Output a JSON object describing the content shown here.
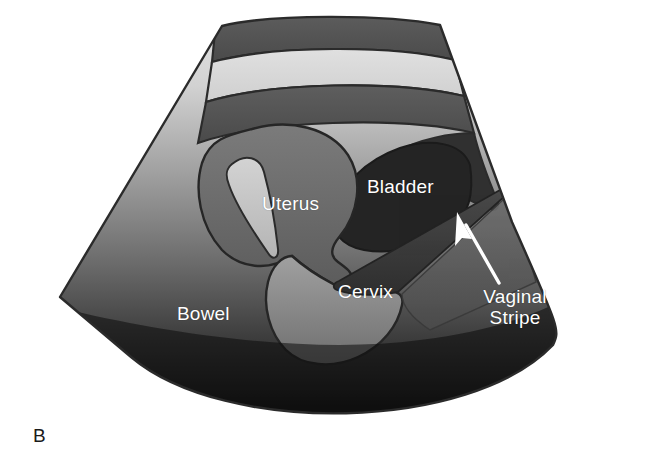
{
  "figure": {
    "panel_letter": "B",
    "panel_letter_color": "#1a1a1a",
    "background_color": "#ffffff",
    "modality": "transabdominal-pelvic-ultrasound-schematic",
    "width": 648,
    "height": 473
  },
  "scan_sector": {
    "outline_color": "#2b2b2b",
    "gradient_top_color": "#e3e3e3",
    "gradient_mid_color": "#8a8a8a",
    "gradient_bottom_color": "#0a0a0a"
  },
  "layers": [
    {
      "name": "skin-band",
      "shade": "#595959"
    },
    {
      "name": "fat-band",
      "shade": "#d7d7d7"
    },
    {
      "name": "muscle-band",
      "shade": "#4a4a4a"
    }
  ],
  "structures": [
    {
      "id": "uterus",
      "label": "Uterus",
      "shade": "#6e6e6e",
      "echogenicity": "hypoechoic"
    },
    {
      "id": "endometrium",
      "label": "",
      "shade": "#c9c9c9",
      "echogenicity": "hyperechoic-stripe"
    },
    {
      "id": "bladder",
      "label": "Bladder",
      "shade": "#232323",
      "echogenicity": "anechoic"
    },
    {
      "id": "cervix",
      "label": "Cervix",
      "shade": "#8d8d8d",
      "echogenicity": "isoechoic"
    },
    {
      "id": "bowel",
      "label": "Bowel",
      "shade": "#4f4f4f",
      "echogenicity": "mixed"
    },
    {
      "id": "vaginal-stripe",
      "label": "Vaginal\nStripe",
      "shade": "#3a3a3a",
      "echogenicity": "hyperechoic-line"
    }
  ],
  "labels": {
    "uterus": "Uterus",
    "bladder": "Bladder",
    "cervix": "Cervix",
    "bowel": "Bowel",
    "vaginal_stripe": "Vaginal\nStripe",
    "text_color": "#ffffff",
    "font_size_px": 19
  },
  "annotations": [
    {
      "id": "vaginal-stripe-pointer",
      "type": "arrow",
      "color": "#ffffff",
      "points_to": "vaginal-stripe",
      "from_x": 499,
      "from_y": 283,
      "to_x": 458,
      "to_y": 218
    }
  ]
}
